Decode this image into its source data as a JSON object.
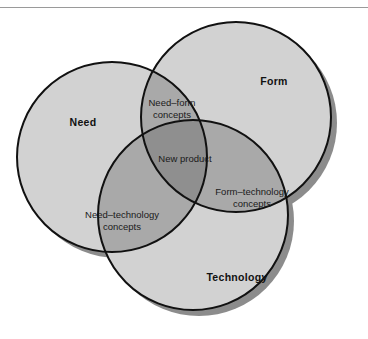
{
  "figure": {
    "type": "venn-diagram",
    "title": "",
    "sets": [
      {
        "id": "need",
        "label": "Need",
        "label_x": 83,
        "label_y": 126
      },
      {
        "id": "form",
        "label": "Form",
        "label_x": 274,
        "label_y": 85
      },
      {
        "id": "technology",
        "label": "Technology",
        "label_x": 237,
        "label_y": 281
      }
    ],
    "regions": [
      {
        "id": "need-form",
        "lines": [
          "Need–form",
          "concepts"
        ],
        "line1": "Need–form",
        "line2": "concepts",
        "x": 172,
        "y": 106
      },
      {
        "id": "need-technology",
        "lines": [
          "Need–technology",
          "concepts"
        ],
        "line1": "Need–technology",
        "line2": "concepts",
        "x": 122,
        "y": 218
      },
      {
        "id": "form-technology",
        "lines": [
          "Form–technology",
          "concepts"
        ],
        "line1": "Form–technology",
        "line2": "concepts",
        "x": 252,
        "y": 195
      },
      {
        "id": "center",
        "lines": [
          "New product"
        ],
        "line1": "New product",
        "line2": "",
        "x": 185,
        "y": 162
      }
    ],
    "colors": {
      "single_fill": "#d2d2d2",
      "pair_fill": "#a9a9a9",
      "center_fill": "#8f8f8f",
      "outline": "#111111",
      "shadow": "#8c8c8c",
      "rule": "#9a9a9a",
      "background": "#ffffff",
      "text": "#1a1a1a"
    }
  }
}
